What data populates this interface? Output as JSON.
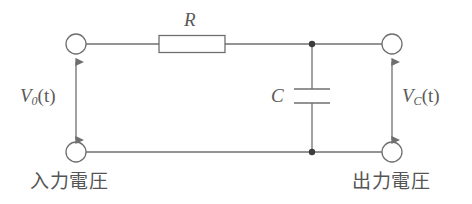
{
  "diagram": {
    "colors": {
      "background": "#ffffff",
      "wire": "#6f6f6f",
      "component_outline": "#6f6f6f",
      "node_dot": "#3c3c3c",
      "arrow": "#6f6f6f",
      "label_text": "#5a5a5a"
    },
    "labels": {
      "resistor": "R",
      "capacitor": "C",
      "input_voltage_symbol_base": "V",
      "input_voltage_symbol_sub": "0",
      "input_voltage_symbol_arg": "(t)",
      "output_voltage_symbol_base": "V",
      "output_voltage_symbol_sub": "C",
      "output_voltage_symbol_arg": "(t)",
      "input_caption": "入力電圧",
      "output_caption": "出力電圧"
    },
    "components": [
      {
        "name": "resistor",
        "type": "resistor",
        "label": "R",
        "orientation": "horizontal"
      },
      {
        "name": "capacitor",
        "type": "capacitor",
        "label": "C",
        "orientation": "vertical"
      }
    ],
    "terminals": [
      {
        "name": "input-top",
        "x": 76,
        "y": 44
      },
      {
        "name": "input-bottom",
        "x": 76,
        "y": 152
      },
      {
        "name": "output-top",
        "x": 392,
        "y": 44
      },
      {
        "name": "output-bottom",
        "x": 392,
        "y": 152
      }
    ],
    "nodes": [
      {
        "name": "junction-top",
        "x": 312,
        "y": 44
      },
      {
        "name": "junction-bottom",
        "x": 312,
        "y": 152
      }
    ],
    "measurements": [
      {
        "name": "input-voltage-arrow",
        "label": "V0(t)",
        "from_y": 60,
        "to_y": 142,
        "x": 76
      },
      {
        "name": "output-voltage-arrow",
        "label": "VC(t)",
        "from_y": 60,
        "to_y": 142,
        "x": 392
      }
    ]
  }
}
